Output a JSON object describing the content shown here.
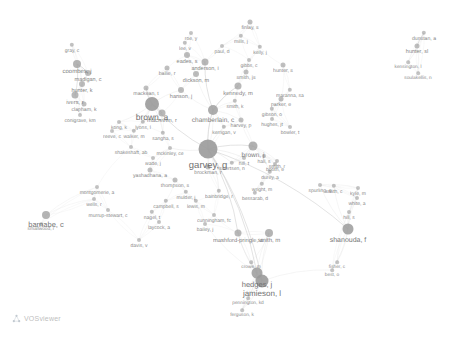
{
  "app": {
    "name": "VOSviewer",
    "watermark_label": "VOSviewer",
    "logo_icon": "vosviewer-network-icon",
    "background_color": "#ffffff",
    "node_color": "#9a9a9a",
    "edge_color": "#d8d8d8",
    "label_color": "#6f6f6f",
    "view_type": "co-authorship network map",
    "width": 459,
    "height": 343
  },
  "chart_data": {
    "type": "scatter",
    "title": "",
    "xlabel": "",
    "ylabel": "",
    "grid": false,
    "legend": "none",
    "xlim": [
      0,
      459
    ],
    "ylim": [
      0,
      343
    ],
    "nodes": [
      {
        "label": "garvey, g",
        "x": 208,
        "y": 149,
        "r": 9.5,
        "font": 9.5,
        "weight": 100
      },
      {
        "label": "brown, a",
        "x": 152,
        "y": 104,
        "r": 7.0,
        "font": 8.5,
        "weight": 78
      },
      {
        "label": "chamberlain, c",
        "x": 213,
        "y": 110,
        "r": 5.0,
        "font": 6.5,
        "weight": 62
      },
      {
        "label": "jamieson, l",
        "x": 262,
        "y": 281,
        "r": 6.5,
        "font": 8.0,
        "weight": 70
      },
      {
        "label": "hedges, j",
        "x": 257,
        "y": 273,
        "r": 5.5,
        "font": 7.5,
        "weight": 64
      },
      {
        "label": "shanouda, f",
        "x": 348,
        "y": 229,
        "r": 5.5,
        "font": 7.0,
        "weight": 58
      },
      {
        "label": "barnabe, c",
        "x": 46,
        "y": 215,
        "r": 4.0,
        "font": 7.5,
        "weight": 55
      },
      {
        "label": "brown, j",
        "x": 253,
        "y": 146,
        "r": 4.5,
        "font": 6.5,
        "weight": 52
      },
      {
        "label": "smith, m",
        "x": 269,
        "y": 233,
        "r": 4.0,
        "font": 6.0,
        "weight": 48
      },
      {
        "label": "mashford-pringle, a",
        "x": 238,
        "y": 233,
        "r": 3.5,
        "font": 5.8,
        "weight": 46
      },
      {
        "label": "macniven, r",
        "x": 162,
        "y": 113,
        "r": 3.5,
        "font": 5.8,
        "weight": 45
      },
      {
        "label": "kennedy, m",
        "x": 238,
        "y": 86,
        "r": 3.5,
        "font": 5.8,
        "weight": 44
      },
      {
        "label": "anderson, i",
        "x": 205,
        "y": 62,
        "r": 3.5,
        "font": 5.5,
        "weight": 43
      },
      {
        "label": "coombes, j",
        "x": 77,
        "y": 64,
        "r": 4.0,
        "font": 6.0,
        "weight": 47
      },
      {
        "label": "madigan, c",
        "x": 88,
        "y": 73,
        "r": 3.0,
        "font": 5.5,
        "weight": 40
      },
      {
        "label": "hunter, k",
        "x": 82,
        "y": 84,
        "r": 3.0,
        "font": 5.5,
        "weight": 39
      },
      {
        "label": "ivers, r",
        "x": 75,
        "y": 95,
        "r": 3.5,
        "font": 5.8,
        "weight": 42
      },
      {
        "label": "clapham, k",
        "x": 84,
        "y": 104,
        "r": 2.5,
        "font": 5.2,
        "weight": 34
      },
      {
        "label": "conigrave, km",
        "x": 80,
        "y": 115,
        "r": 2.0,
        "font": 5.0,
        "weight": 30
      },
      {
        "label": "gray, c",
        "x": 72,
        "y": 45,
        "r": 2.2,
        "font": 5.0,
        "weight": 31
      },
      {
        "label": "hanson, j",
        "x": 181,
        "y": 90,
        "r": 3.0,
        "font": 5.5,
        "weight": 38
      },
      {
        "label": "dickson, m",
        "x": 196,
        "y": 74,
        "r": 3.0,
        "font": 5.5,
        "weight": 37
      },
      {
        "label": "bailie, r",
        "x": 167,
        "y": 68,
        "r": 2.5,
        "font": 5.2,
        "weight": 33
      },
      {
        "label": "eades, s",
        "x": 187,
        "y": 55,
        "r": 3.0,
        "font": 5.5,
        "weight": 36
      },
      {
        "label": "lee, v",
        "x": 185,
        "y": 43,
        "r": 2.2,
        "font": 5.0,
        "weight": 29
      },
      {
        "label": "finlay, s",
        "x": 250,
        "y": 22,
        "r": 2.5,
        "font": 5.2,
        "weight": 32
      },
      {
        "label": "mills, j",
        "x": 241,
        "y": 36,
        "r": 2.2,
        "font": 5.0,
        "weight": 28
      },
      {
        "label": "smith, js",
        "x": 246,
        "y": 72,
        "r": 2.5,
        "font": 5.2,
        "weight": 33
      },
      {
        "label": "gibbs, c",
        "x": 249,
        "y": 60,
        "r": 2.0,
        "font": 5.0,
        "weight": 27
      },
      {
        "label": "kelly, j",
        "x": 260,
        "y": 47,
        "r": 2.2,
        "font": 5.0,
        "weight": 29
      },
      {
        "label": "hunter, s",
        "x": 283,
        "y": 65,
        "r": 2.5,
        "font": 5.2,
        "weight": 31
      },
      {
        "label": "maranna, sa",
        "x": 290,
        "y": 90,
        "r": 2.2,
        "font": 5.0,
        "weight": 28
      },
      {
        "label": "parker, e",
        "x": 281,
        "y": 99,
        "r": 2.5,
        "font": 5.2,
        "weight": 30
      },
      {
        "label": "gibson, o",
        "x": 272,
        "y": 109,
        "r": 2.2,
        "font": 5.0,
        "weight": 27
      },
      {
        "label": "hughes, jt",
        "x": 272,
        "y": 119,
        "r": 2.0,
        "font": 5.0,
        "weight": 26
      },
      {
        "label": "harvey, p",
        "x": 241,
        "y": 120,
        "r": 2.5,
        "font": 5.2,
        "weight": 32
      },
      {
        "label": "kerrigan, v",
        "x": 224,
        "y": 127,
        "r": 2.2,
        "font": 5.0,
        "weight": 28
      },
      {
        "label": "smith, k",
        "x": 235,
        "y": 101,
        "r": 2.2,
        "font": 5.0,
        "weight": 28
      },
      {
        "label": "sangha, s",
        "x": 163,
        "y": 133,
        "r": 2.2,
        "font": 5.0,
        "weight": 28
      },
      {
        "label": "lyons, l",
        "x": 143,
        "y": 122,
        "r": 2.2,
        "font": 5.0,
        "weight": 27
      },
      {
        "label": "walker, m",
        "x": 134,
        "y": 131,
        "r": 2.2,
        "font": 5.0,
        "weight": 27
      },
      {
        "label": "shakeshaft, ab",
        "x": 131,
        "y": 147,
        "r": 2.0,
        "font": 5.0,
        "weight": 25
      },
      {
        "label": "mckinley, ce",
        "x": 170,
        "y": 148,
        "r": 2.0,
        "font": 5.0,
        "weight": 25
      },
      {
        "label": "wade, j",
        "x": 153,
        "y": 158,
        "r": 2.0,
        "font": 5.0,
        "weight": 25
      },
      {
        "label": "yashadhana, a",
        "x": 150,
        "y": 170,
        "r": 2.5,
        "font": 5.2,
        "weight": 31
      },
      {
        "label": "brockman, r",
        "x": 208,
        "y": 167,
        "r": 2.5,
        "font": 5.2,
        "weight": 30
      },
      {
        "label": "sivertsen, n",
        "x": 232,
        "y": 163,
        "r": 2.2,
        "font": 5.0,
        "weight": 28
      },
      {
        "label": "thompson, s",
        "x": 175,
        "y": 180,
        "r": 2.5,
        "font": 5.2,
        "weight": 30
      },
      {
        "label": "mulder, j",
        "x": 186,
        "y": 192,
        "r": 2.2,
        "font": 5.0,
        "weight": 27
      },
      {
        "label": "montgomerie, a",
        "x": 97,
        "y": 187,
        "r": 2.0,
        "font": 5.0,
        "weight": 25
      },
      {
        "label": "wells, r",
        "x": 94,
        "y": 199,
        "r": 2.0,
        "font": 5.0,
        "weight": 25
      },
      {
        "label": "murrup-stewart, c",
        "x": 108,
        "y": 210,
        "r": 2.0,
        "font": 5.0,
        "weight": 25
      },
      {
        "label": "campbell, s",
        "x": 166,
        "y": 201,
        "r": 2.2,
        "font": 5.0,
        "weight": 27
      },
      {
        "label": "lewis, m",
        "x": 196,
        "y": 201,
        "r": 2.2,
        "font": 5.0,
        "weight": 27
      },
      {
        "label": "nagel, t",
        "x": 152,
        "y": 212,
        "r": 2.2,
        "font": 5.0,
        "weight": 27
      },
      {
        "label": "laycock, a",
        "x": 159,
        "y": 222,
        "r": 2.0,
        "font": 5.0,
        "weight": 25
      },
      {
        "label": "cunningham, fc",
        "x": 214,
        "y": 215,
        "r": 2.0,
        "font": 5.0,
        "weight": 25
      },
      {
        "label": "bailey, j",
        "x": 205,
        "y": 224,
        "r": 2.0,
        "font": 5.0,
        "weight": 25
      },
      {
        "label": "davis, v",
        "x": 139,
        "y": 240,
        "r": 2.0,
        "font": 5.0,
        "weight": 25
      },
      {
        "label": "bainbridge, r",
        "x": 219,
        "y": 191,
        "r": 2.2,
        "font": 5.0,
        "weight": 27
      },
      {
        "label": "bessarab, d",
        "x": 255,
        "y": 193,
        "r": 2.2,
        "font": 5.0,
        "weight": 27
      },
      {
        "label": "wright, m",
        "x": 262,
        "y": 184,
        "r": 2.2,
        "font": 5.0,
        "weight": 27
      },
      {
        "label": "durey, a",
        "x": 270,
        "y": 172,
        "r": 2.2,
        "font": 5.0,
        "weight": 27
      },
      {
        "label": "smith, r",
        "x": 277,
        "y": 161,
        "r": 2.0,
        "font": 5.0,
        "weight": 25
      },
      {
        "label": "booth, e",
        "x": 275,
        "y": 164,
        "r": 2.0,
        "font": 5.0,
        "weight": 25
      },
      {
        "label": "hall, s",
        "x": 264,
        "y": 156,
        "r": 2.0,
        "font": 5.0,
        "weight": 25
      },
      {
        "label": "smith, c",
        "x": 334,
        "y": 186,
        "r": 2.2,
        "font": 5.0,
        "weight": 27
      },
      {
        "label": "kyle, m",
        "x": 358,
        "y": 188,
        "r": 2.0,
        "font": 5.0,
        "weight": 25
      },
      {
        "label": "white, a",
        "x": 357,
        "y": 198,
        "r": 2.0,
        "font": 5.0,
        "weight": 25
      },
      {
        "label": "hill, s",
        "x": 349,
        "y": 212,
        "r": 2.0,
        "font": 5.0,
        "weight": 25
      },
      {
        "label": "spurling, g",
        "x": 320,
        "y": 185,
        "r": 2.0,
        "font": 5.0,
        "weight": 25
      },
      {
        "label": "fisher, c",
        "x": 337,
        "y": 262,
        "r": 1.8,
        "font": 4.8,
        "weight": 22
      },
      {
        "label": "best, o",
        "x": 332,
        "y": 270,
        "r": 1.8,
        "font": 4.8,
        "weight": 22
      },
      {
        "label": "pennington, kd",
        "x": 248,
        "y": 298,
        "r": 1.8,
        "font": 4.8,
        "weight": 22
      },
      {
        "label": "ferguson, k",
        "x": 242,
        "y": 310,
        "r": 1.8,
        "font": 4.8,
        "weight": 22
      },
      {
        "label": "crowe, m",
        "x": 251,
        "y": 262,
        "r": 1.8,
        "font": 4.8,
        "weight": 22
      },
      {
        "label": "hill, t",
        "x": 244,
        "y": 158,
        "r": 2.0,
        "font": 5.0,
        "weight": 24
      },
      {
        "label": "bowler, t",
        "x": 290,
        "y": 127,
        "r": 2.0,
        "font": 5.0,
        "weight": 24
      },
      {
        "label": "smallwood, r",
        "x": 41,
        "y": 224,
        "r": 1.8,
        "font": 4.8,
        "weight": 22
      },
      {
        "label": "dunstan, a",
        "x": 424,
        "y": 33,
        "r": 2.2,
        "font": 5.2,
        "weight": 28
      },
      {
        "label": "hunter, sl",
        "x": 417,
        "y": 46,
        "r": 2.5,
        "font": 5.5,
        "weight": 30
      },
      {
        "label": "kensington, l",
        "x": 408,
        "y": 62,
        "r": 1.8,
        "font": 4.8,
        "weight": 22
      },
      {
        "label": "soulakellis, n",
        "x": 418,
        "y": 73,
        "r": 1.8,
        "font": 4.8,
        "weight": 22
      },
      {
        "label": "roe, y",
        "x": 191,
        "y": 33,
        "r": 2.0,
        "font": 5.0,
        "weight": 24
      },
      {
        "label": "paul, d",
        "x": 222,
        "y": 46,
        "r": 2.0,
        "font": 5.0,
        "weight": 24
      },
      {
        "label": "mackean, t",
        "x": 146,
        "y": 88,
        "r": 2.5,
        "font": 5.2,
        "weight": 30
      },
      {
        "label": "kong, k",
        "x": 119,
        "y": 122,
        "r": 2.0,
        "font": 5.0,
        "weight": 24
      },
      {
        "label": "reeve, c",
        "x": 112,
        "y": 131,
        "r": 2.0,
        "font": 5.0,
        "weight": 24
      }
    ],
    "edges": [
      {
        "source": "garvey, g",
        "target": "brown, a"
      },
      {
        "source": "garvey, g",
        "target": "chamberlain, c"
      },
      {
        "source": "garvey, g",
        "target": "brown, j"
      },
      {
        "source": "garvey, g",
        "target": "hedges, j"
      },
      {
        "source": "garvey, g",
        "target": "jamieson, l"
      },
      {
        "source": "garvey, g",
        "target": "shanouda, f"
      },
      {
        "source": "garvey, g",
        "target": "mashford-pringle, a"
      },
      {
        "source": "brown, a",
        "target": "macniven, r"
      },
      {
        "source": "brown, a",
        "target": "mackean, t"
      },
      {
        "source": "chamberlain, c",
        "target": "kennedy, m"
      },
      {
        "source": "chamberlain, c",
        "target": "anderson, i"
      },
      {
        "source": "coombes, j",
        "target": "madigan, c"
      },
      {
        "source": "coombes, j",
        "target": "ivers, r"
      },
      {
        "source": "hunter, sl",
        "target": "dunstan, a"
      }
    ]
  }
}
